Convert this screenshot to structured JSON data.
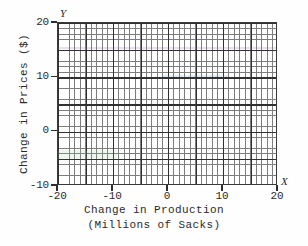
{
  "chart_data": {
    "type": "scatter",
    "title": "",
    "subtitle": "",
    "xlabel": "Change in Production",
    "xlabel_line2": "(Millions of Sacks)",
    "ylabel": "Change in Prices ($)",
    "x_axis_marker": "X",
    "y_axis_marker": "Y",
    "xlim": [
      -20,
      20
    ],
    "ylim": [
      -10,
      20
    ],
    "xticks": [
      -20,
      -10,
      0,
      10,
      20
    ],
    "yticks": [
      -10,
      0,
      10,
      20
    ],
    "xtick_labels": [
      "-20",
      "-10",
      "0",
      "10",
      "20"
    ],
    "ytick_labels": [
      "-10",
      "0",
      "10",
      "20"
    ],
    "grid": true,
    "grid_minor_step": 1,
    "grid_major_step": 5,
    "legend": null,
    "series": [],
    "values": [],
    "annotations": [],
    "note": "Empty grid plot: blank coordinate grid with no plotted data points or curves.",
    "colors": {
      "background": "#fefefe",
      "plot_background": "#ffffff",
      "frame": "#3a3a3a",
      "grid_minor": "#7d7d7d",
      "grid_major": "#303030",
      "text": "#2b2b2b"
    }
  }
}
